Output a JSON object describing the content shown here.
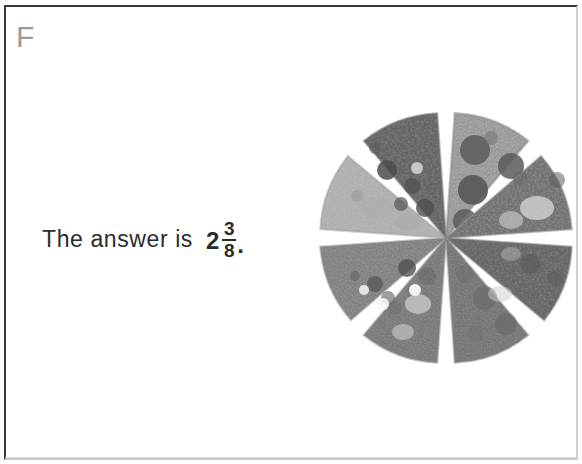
{
  "panel": {
    "label": "F"
  },
  "answer": {
    "prefix": "The answer is",
    "whole": "2",
    "numerator": "3",
    "denominator": "8",
    "terminator": ".",
    "full_text": "The answer is 2 3/8."
  },
  "figure": {
    "name": "pizza-cut-into-eighths",
    "slice_count": 8,
    "fraction_denominator": 8,
    "toppings": [
      "pepperoni",
      "cheese",
      "olives",
      "sausage"
    ],
    "center_x": 131,
    "center_y": 130,
    "radius": 126,
    "gap_degrees": 7,
    "slices": [
      {
        "index": 1,
        "start_angle": -86,
        "end_angle": -49,
        "tone": "#b7b7b7",
        "note": "pepperoni slice, large dark rounds, light cheese"
      },
      {
        "index": 2,
        "start_angle": -41,
        "end_angle": -4,
        "tone": "#9e9e9e",
        "note": "mixed toppings, light cheese patch"
      },
      {
        "index": 3,
        "start_angle": 4,
        "end_angle": 41,
        "tone": "#8f8f8f",
        "note": "dark dense toppings"
      },
      {
        "index": 4,
        "start_angle": 49,
        "end_angle": 86,
        "tone": "#969696",
        "note": "sausage and olive slice"
      },
      {
        "index": 5,
        "start_angle": 94,
        "end_angle": 131,
        "tone": "#9b9b9b",
        "note": "speckled toppings, pale highlights"
      },
      {
        "index": 6,
        "start_angle": 139,
        "end_angle": 176,
        "tone": "#a3a3a3",
        "note": "olives with white cheese dots"
      },
      {
        "index": 7,
        "start_angle": 184,
        "end_angle": 221,
        "tone": "#bcbcbc",
        "note": "lightest cheese-only slice"
      },
      {
        "index": 8,
        "start_angle": 229,
        "end_angle": 266,
        "tone": "#8d8d8d",
        "note": "dark slice with olives and pepperoni"
      }
    ]
  },
  "colors": {
    "page_background": "#ffffff",
    "frame_border": "#3a3a3c",
    "panel_label": "#9a9a9c",
    "text": "#2b2b2d",
    "figure_light": "#d4d4d4",
    "figure_mid": "#9a9a9a",
    "figure_dark": "#4a4a4a"
  }
}
